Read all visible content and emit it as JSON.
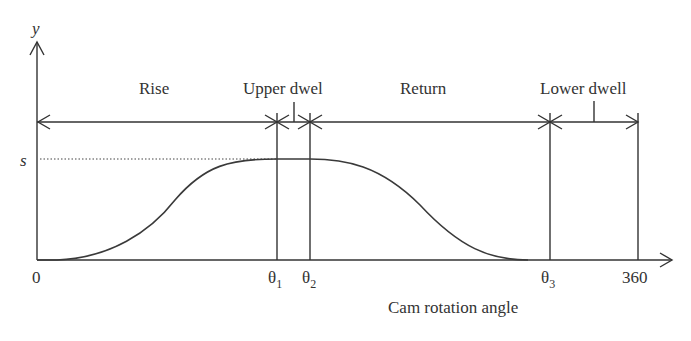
{
  "diagram": {
    "type": "cam displacement diagram",
    "axis_y_label": "y",
    "axis_x_label": "Cam rotation angle",
    "level_label": "s",
    "ticks": {
      "origin": "0",
      "theta1": "θ",
      "theta1_sub": "1",
      "theta2": "θ",
      "theta2_sub": "2",
      "theta3": "θ",
      "theta3_sub": "3",
      "end": "360"
    },
    "segments": {
      "rise": "Rise",
      "upper_dwell": "Upper dwel",
      "return": "Return",
      "lower_dwell": "Lower dwell"
    },
    "colors": {
      "line": "#333333",
      "background": "#ffffff"
    }
  }
}
